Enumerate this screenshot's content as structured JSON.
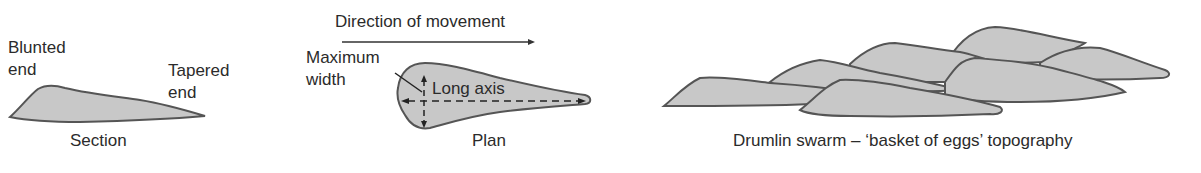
{
  "section_panel": {
    "label_blunted": [
      "Blunted",
      "end"
    ],
    "label_tapered": [
      "Tapered",
      "end"
    ],
    "caption": "Section"
  },
  "plan_panel": {
    "direction_label": "Direction of movement",
    "max_width_label": [
      "Maximum",
      "width"
    ],
    "long_axis_label": "Long axis",
    "caption": "Plan"
  },
  "swarm_panel": {
    "caption": "Drumlin swarm – ‘basket of eggs’ topography"
  },
  "colors": {
    "fill": "#c8c8c8",
    "stroke": "#555555",
    "text": "#2b2b2b"
  }
}
